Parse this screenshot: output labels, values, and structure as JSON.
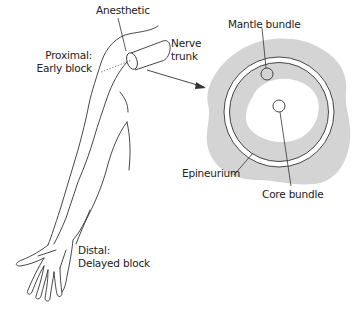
{
  "diagram": {
    "type": "anatomical-illustration",
    "labels": {
      "anesthetic": "Anesthetic",
      "nerve_trunk_line1": "Nerve",
      "nerve_trunk_line2": "trunk",
      "proximal_line1": "Proximal:",
      "proximal_line2": "Early block",
      "distal_line1": "Distal:",
      "distal_line2": "Delayed block",
      "mantle_bundle": "Mantle bundle",
      "epineurium": "Epineurium",
      "core_bundle": "Core bundle"
    },
    "colors": {
      "line": "#333333",
      "shading": "#d4d4d4",
      "background": "#ffffff"
    }
  }
}
